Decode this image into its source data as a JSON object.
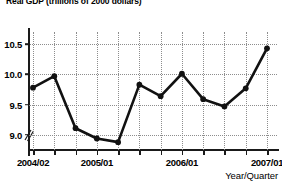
{
  "chart_data": {
    "type": "line",
    "title": "Real GDP (trillions of 2000 dollars)",
    "xlabel": "Year/Quarter",
    "ylabel": "",
    "grid": true,
    "legend": false,
    "ylim": [
      8.75,
      10.7
    ],
    "yticks": [
      "9.0",
      "9.5",
      "10.0",
      "10.5"
    ],
    "ytick_values": [
      9.0,
      9.5,
      10.0,
      10.5
    ],
    "axis_break": "//",
    "categories": [
      "2004/02",
      "2004/03",
      "2004/04",
      "2005/01",
      "2005/02",
      "2005/03",
      "2005/04",
      "2006/01",
      "2006/02",
      "2006/03",
      "2006/04",
      "2007/01"
    ],
    "xtick_labels": [
      "2004/02",
      "2005/01",
      "2006/01",
      "2007/01"
    ],
    "xtick_label_indices": [
      0,
      3,
      7,
      11
    ],
    "values": [
      9.78,
      9.97,
      9.11,
      8.94,
      8.88,
      9.83,
      9.64,
      10.01,
      9.59,
      9.47,
      9.77,
      10.43
    ],
    "series": [
      {
        "name": "Real GDP",
        "values": [
          9.78,
          9.97,
          9.11,
          8.94,
          8.88,
          9.83,
          9.64,
          10.01,
          9.59,
          9.47,
          9.77,
          10.43
        ]
      }
    ],
    "line_color": "#111111",
    "marker": "circle",
    "marker_color": "#111111"
  }
}
